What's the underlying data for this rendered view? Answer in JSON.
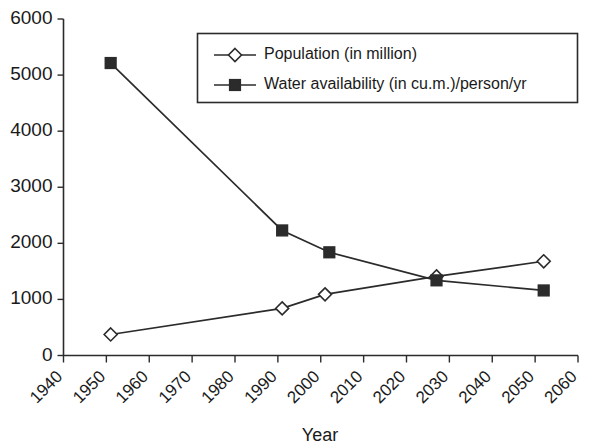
{
  "chart_data": {
    "type": "line",
    "title": "",
    "xlabel": "Year",
    "ylabel": "",
    "xlim": [
      1940,
      2060
    ],
    "ylim": [
      0,
      6000
    ],
    "grid": false,
    "legend_position": "top-right",
    "x_ticks": [
      "1940",
      "1950",
      "1960",
      "1970",
      "1980",
      "1990",
      "2000",
      "2010",
      "2020",
      "2030",
      "2040",
      "2050",
      "2060"
    ],
    "y_ticks": [
      "0",
      "1000",
      "2000",
      "3000",
      "4000",
      "5000",
      "6000"
    ],
    "series": [
      {
        "name": "Population (in million)",
        "marker": "open-diamond",
        "x": [
          1951,
          1991,
          2001,
          2027,
          2052
        ],
        "values": [
          375,
          840,
          1090,
          1410,
          1680
        ]
      },
      {
        "name": "Water availability (in cu.m.)/person/yr",
        "marker": "filled-square",
        "x": [
          1951,
          1991,
          2002,
          2027,
          2052
        ],
        "values": [
          5215,
          2230,
          1840,
          1340,
          1160
        ]
      }
    ]
  },
  "legend": {
    "entries": [
      {
        "label": "Population (in million)"
      },
      {
        "label": "Water availability (in cu.m.)/person/yr"
      }
    ]
  },
  "axes": {
    "x_title": "Year"
  },
  "colors": {
    "ink": "#2b2b2b",
    "background": "#ffffff"
  }
}
